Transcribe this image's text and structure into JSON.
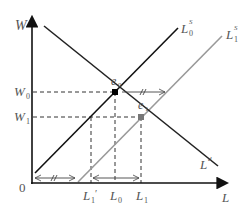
{
  "diagram": {
    "type": "labor-market supply-demand",
    "axes": {
      "y_label": "W",
      "x_label": "L",
      "origin_label": "0"
    },
    "curves": {
      "demand": {
        "label": "L",
        "sup": "d",
        "color": "#222222"
      },
      "supply_0": {
        "label": "L",
        "sup": "S",
        "sub": "0",
        "color": "#111111"
      },
      "supply_1": {
        "label": "L",
        "sup": "S",
        "sub": "1",
        "color": "#999999"
      }
    },
    "points": {
      "e0": {
        "label": "e",
        "sub": "0",
        "color": "#000000"
      },
      "e1": {
        "label": "e",
        "sub": "1",
        "color": "#777777"
      }
    },
    "y_ticks": [
      {
        "label": "W",
        "sub": "0"
      },
      {
        "label": "W",
        "sub": "1"
      }
    ],
    "x_ticks": [
      {
        "label": "L",
        "sub": "1",
        "prime": "′"
      },
      {
        "label": "L",
        "sub": "0"
      },
      {
        "label": "L",
        "sub": "1"
      }
    ],
    "annotations": {
      "shift_marker": "//"
    }
  }
}
